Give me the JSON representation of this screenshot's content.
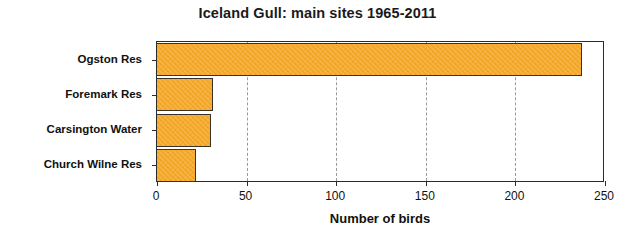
{
  "chart_data": {
    "type": "bar",
    "orientation": "horizontal",
    "title": "Iceland Gull: main sites 1965-2011",
    "xlabel": "Number of birds",
    "ylabel": "",
    "categories": [
      "Ogston Res",
      "Foremark Res",
      "Carsington Water",
      "Church Wilne Res"
    ],
    "values": [
      237,
      31,
      30,
      22
    ],
    "xlim": [
      0,
      250
    ],
    "xticks": [
      0,
      50,
      100,
      150,
      200,
      250
    ],
    "xtick_labels": [
      "0",
      "50",
      "100",
      "150",
      "200",
      "250"
    ],
    "grid": "vertical-dashed",
    "legend": "none",
    "bar_color": "#f5a623",
    "bar_edge_color": "#3a3226",
    "gridline_color": "#9a9a9a",
    "axis_color": "#2b2b2b",
    "background_color": "#ffffff"
  }
}
